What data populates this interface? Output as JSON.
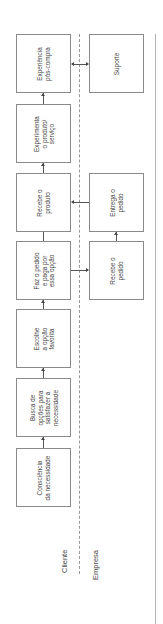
{
  "diagram": {
    "title": "",
    "lanes": [
      {
        "id": "cliente",
        "label": "Cliente"
      },
      {
        "id": "empresa",
        "label": "Empresa"
      }
    ],
    "cliente_steps": [
      {
        "id": "c1",
        "label": "Consciência\nda necessidade"
      },
      {
        "id": "c2",
        "label": "Busca de\nopções para\nsatisfazer a\nnecessidade"
      },
      {
        "id": "c3",
        "label": "Escolhe\na opção\nfavorita"
      },
      {
        "id": "c4",
        "label": "Faz o pedido\ne paga por\nessa opção"
      },
      {
        "id": "c5",
        "label": "Recebe o\nproduto"
      },
      {
        "id": "c6",
        "label": "Experimenta\no produto/\nserviço"
      },
      {
        "id": "c7",
        "label": "Experiência\npós-compra"
      }
    ],
    "empresa_steps": [
      {
        "id": "e1",
        "label": "Recebe o\npedido"
      },
      {
        "id": "e2",
        "label": "Entrega o\npedido"
      },
      {
        "id": "e3",
        "label": "Suporte"
      }
    ],
    "connections": [
      {
        "from": "c1",
        "to": "c2",
        "type": "arrow"
      },
      {
        "from": "c2",
        "to": "c3",
        "type": "arrow"
      },
      {
        "from": "c3",
        "to": "c4",
        "type": "arrow"
      },
      {
        "from": "c4",
        "to": "e1",
        "type": "arrow"
      },
      {
        "from": "e1",
        "to": "e2",
        "type": "arrow"
      },
      {
        "from": "e2",
        "to": "c5",
        "type": "arrow"
      },
      {
        "from": "c5",
        "to": "c6",
        "type": "arrow"
      },
      {
        "from": "c6",
        "to": "c7",
        "type": "arrow"
      },
      {
        "from": "c7",
        "to": "e3",
        "type": "bidirectional"
      }
    ],
    "orientation": "rotated-90-ccw",
    "colors": {
      "stroke": "#8a8a8a",
      "text": "#444444",
      "arrow": "#444444"
    }
  }
}
